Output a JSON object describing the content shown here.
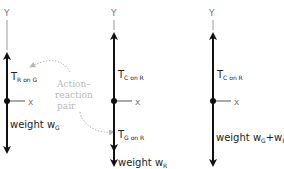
{
  "colors": {
    "vector": "#111111",
    "axis": "#9a9a9a",
    "annotation": "#b8b8b8",
    "text": "#222222"
  },
  "diagrams": [
    {
      "name": "gymnast",
      "y_axis": "Y",
      "x_axis": "x",
      "upper_force": {
        "main": "T",
        "sub": "R on G"
      },
      "lower_force": {
        "main": "weight w",
        "sub": "G"
      }
    },
    {
      "name": "rope",
      "y_axis": "Y",
      "x_axis": "x",
      "upper_force": {
        "main": "T",
        "sub": "C on R"
      },
      "middle_force": {
        "main": "T",
        "sub": "G on R"
      },
      "lower_force": {
        "main": "weight w",
        "sub": "R"
      }
    },
    {
      "name": "combined",
      "y_axis": "Y",
      "x_axis": "x",
      "upper_force": {
        "main": "T",
        "sub": "C on R"
      },
      "lower_force": {
        "main": "weight w",
        "sub1": "G",
        "plus": "+w",
        "sub2": "R"
      }
    }
  ],
  "annotation": {
    "line1": "Action–",
    "line2": "reaction",
    "line3": "pair"
  }
}
